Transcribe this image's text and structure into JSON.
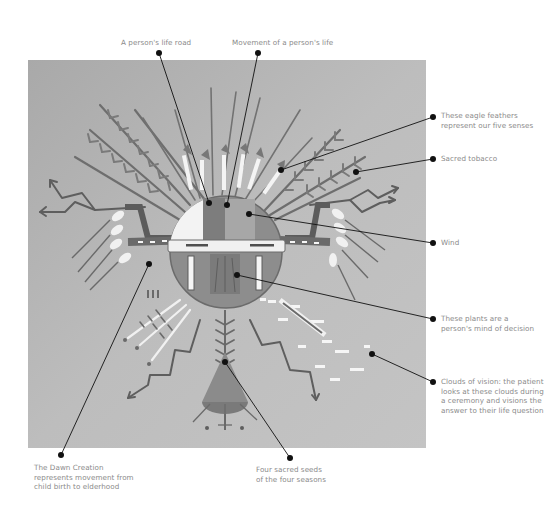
{
  "figure": {
    "panel_color": "#b7b7b7",
    "line_color": "#111111",
    "label_color": "#8a8a8a"
  },
  "labels": {
    "life_road": "A person's life road",
    "movement": "Movement of a person's life",
    "eagle_feathers": [
      "These eagle feathers",
      "represent our five senses"
    ],
    "sacred_tobacco": "Sacred tobacco",
    "wind": "Wind",
    "plants": [
      "These plants are a",
      "person's mind of decision"
    ],
    "clouds": [
      "Clouds of vision: the patient",
      "looks at these clouds during",
      "a ceremony and visions the",
      "answer to their life question"
    ],
    "dawn_creation": [
      "The Dawn Creation",
      "represents movement from",
      "child birth to elderhood"
    ],
    "four_seeds": [
      "Four sacred seeds",
      "of the four seasons"
    ]
  }
}
